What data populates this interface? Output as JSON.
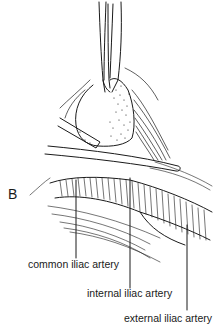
{
  "figure": {
    "panel_letter": "B",
    "labels": [
      {
        "id": "common",
        "text": "common iliac artery"
      },
      {
        "id": "internal",
        "text": "internal iliac artery"
      },
      {
        "id": "external",
        "text": "external iliac artery"
      }
    ],
    "colors": {
      "ink": "#1a1a1a",
      "background": "#ffffff"
    }
  }
}
